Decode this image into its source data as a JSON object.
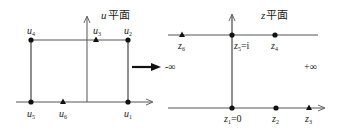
{
  "left_panel": {
    "title_var": "u",
    "title_suffix": "平面",
    "points": [
      {
        "id": "u1",
        "base": "u",
        "sub": "1",
        "x": 128,
        "y": 102,
        "marker": "dot"
      },
      {
        "id": "u2",
        "base": "u",
        "sub": "2",
        "x": 128,
        "y": 40,
        "marker": "dot"
      },
      {
        "id": "u3",
        "base": "u",
        "sub": "3",
        "x": 96,
        "y": 40,
        "marker": "triangle"
      },
      {
        "id": "u4",
        "base": "u",
        "sub": "4",
        "x": 31,
        "y": 40,
        "marker": "dot"
      },
      {
        "id": "u5",
        "base": "u",
        "sub": "5",
        "x": 31,
        "y": 102,
        "marker": "dot"
      },
      {
        "id": "u6",
        "base": "u",
        "sub": "6",
        "x": 63,
        "y": 102,
        "marker": "triangle"
      }
    ]
  },
  "right_panel": {
    "title_var": "z",
    "title_suffix": "平面",
    "points": [
      {
        "id": "z1",
        "base": "z",
        "sub": "1",
        "suffix": "=0",
        "x": 232,
        "y": 108,
        "marker": "dot"
      },
      {
        "id": "z2",
        "base": "z",
        "sub": "2",
        "suffix": "",
        "x": 276,
        "y": 108,
        "marker": "dot"
      },
      {
        "id": "z3",
        "base": "z",
        "sub": "3",
        "suffix": "",
        "x": 309,
        "y": 108,
        "marker": "triangle"
      },
      {
        "id": "z4",
        "base": "z",
        "sub": "4",
        "suffix": "",
        "x": 275,
        "y": 35,
        "marker": "dot"
      },
      {
        "id": "z5",
        "base": "z",
        "sub": "5",
        "suffix": "=i",
        "x": 232,
        "y": 35,
        "marker": "dot"
      },
      {
        "id": "z6",
        "base": "z",
        "sub": "6",
        "suffix": "",
        "x": 182,
        "y": 35,
        "marker": "triangle"
      }
    ],
    "minus_infinity": "-∞",
    "plus_infinity": "+∞"
  },
  "colors": {
    "line": "#555555",
    "point": "#111111",
    "text": "#222222"
  }
}
